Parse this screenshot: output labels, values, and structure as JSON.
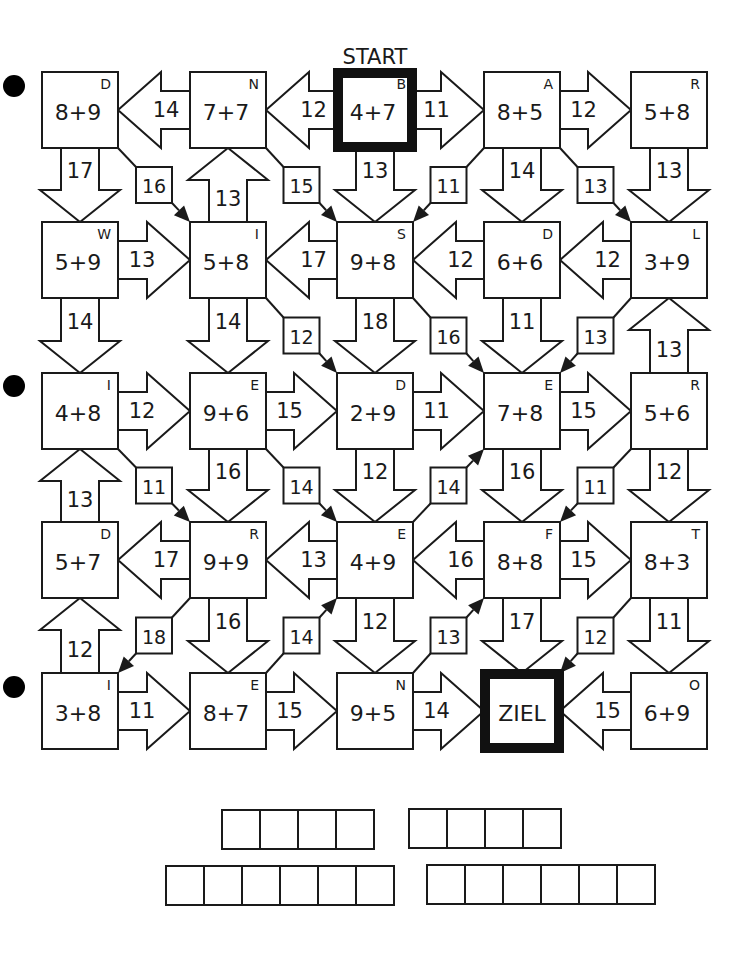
{
  "title": "START",
  "goal_label": "ZIEL",
  "grid": {
    "col_x": [
      42,
      190,
      337,
      484,
      631
    ],
    "row_y": [
      72,
      222,
      373,
      522,
      673
    ],
    "box_size": 76
  },
  "cells": [
    {
      "r": 0,
      "c": 0,
      "expr": "8+9",
      "letter": "D"
    },
    {
      "r": 0,
      "c": 1,
      "expr": "7+7",
      "letter": "N"
    },
    {
      "r": 0,
      "c": 2,
      "expr": "4+7",
      "letter": "B",
      "start": true
    },
    {
      "r": 0,
      "c": 3,
      "expr": "8+5",
      "letter": "A"
    },
    {
      "r": 0,
      "c": 4,
      "expr": "5+8",
      "letter": "R"
    },
    {
      "r": 1,
      "c": 0,
      "expr": "5+9",
      "letter": "W"
    },
    {
      "r": 1,
      "c": 1,
      "expr": "5+8",
      "letter": "I"
    },
    {
      "r": 1,
      "c": 2,
      "expr": "9+8",
      "letter": "S"
    },
    {
      "r": 1,
      "c": 3,
      "expr": "6+6",
      "letter": "D"
    },
    {
      "r": 1,
      "c": 4,
      "expr": "3+9",
      "letter": "L"
    },
    {
      "r": 2,
      "c": 0,
      "expr": "4+8",
      "letter": "I"
    },
    {
      "r": 2,
      "c": 1,
      "expr": "9+6",
      "letter": "E"
    },
    {
      "r": 2,
      "c": 2,
      "expr": "2+9",
      "letter": "D"
    },
    {
      "r": 2,
      "c": 3,
      "expr": "7+8",
      "letter": "E"
    },
    {
      "r": 2,
      "c": 4,
      "expr": "5+6",
      "letter": "R"
    },
    {
      "r": 3,
      "c": 0,
      "expr": "5+7",
      "letter": "D"
    },
    {
      "r": 3,
      "c": 1,
      "expr": "9+9",
      "letter": "R"
    },
    {
      "r": 3,
      "c": 2,
      "expr": "4+9",
      "letter": "E"
    },
    {
      "r": 3,
      "c": 3,
      "expr": "8+8",
      "letter": "F"
    },
    {
      "r": 3,
      "c": 4,
      "expr": "8+3",
      "letter": "T"
    },
    {
      "r": 4,
      "c": 0,
      "expr": "3+8",
      "letter": "I"
    },
    {
      "r": 4,
      "c": 1,
      "expr": "8+7",
      "letter": "E"
    },
    {
      "r": 4,
      "c": 2,
      "expr": "9+5",
      "letter": "N"
    },
    {
      "r": 4,
      "c": 3,
      "expr": "ZIEL",
      "letter": "",
      "goal": true
    },
    {
      "r": 4,
      "c": 4,
      "expr": "6+9",
      "letter": "O"
    }
  ],
  "h_arrows": [
    {
      "r": 0,
      "c": 0,
      "dir": "left",
      "value": "14"
    },
    {
      "r": 0,
      "c": 1,
      "dir": "left",
      "value": "12"
    },
    {
      "r": 0,
      "c": 2,
      "dir": "right",
      "value": "11"
    },
    {
      "r": 0,
      "c": 3,
      "dir": "right",
      "value": "12"
    },
    {
      "r": 1,
      "c": 0,
      "dir": "right",
      "value": "13"
    },
    {
      "r": 1,
      "c": 1,
      "dir": "left",
      "value": "17"
    },
    {
      "r": 1,
      "c": 2,
      "dir": "left",
      "value": "12"
    },
    {
      "r": 1,
      "c": 3,
      "dir": "left",
      "value": "12"
    },
    {
      "r": 2,
      "c": 0,
      "dir": "right",
      "value": "12"
    },
    {
      "r": 2,
      "c": 1,
      "dir": "right",
      "value": "15"
    },
    {
      "r": 2,
      "c": 2,
      "dir": "right",
      "value": "11"
    },
    {
      "r": 2,
      "c": 3,
      "dir": "right",
      "value": "15"
    },
    {
      "r": 3,
      "c": 0,
      "dir": "left",
      "value": "17"
    },
    {
      "r": 3,
      "c": 1,
      "dir": "left",
      "value": "13"
    },
    {
      "r": 3,
      "c": 2,
      "dir": "left",
      "value": "16"
    },
    {
      "r": 3,
      "c": 3,
      "dir": "right",
      "value": "15"
    },
    {
      "r": 4,
      "c": 0,
      "dir": "right",
      "value": "11"
    },
    {
      "r": 4,
      "c": 1,
      "dir": "right",
      "value": "15"
    },
    {
      "r": 4,
      "c": 2,
      "dir": "right",
      "value": "14"
    },
    {
      "r": 4,
      "c": 3,
      "dir": "left",
      "value": "15"
    }
  ],
  "v_arrows": [
    {
      "r": 0,
      "c": 0,
      "dir": "down",
      "value": "17"
    },
    {
      "r": 0,
      "c": 1,
      "dir": "up",
      "value": "13"
    },
    {
      "r": 0,
      "c": 2,
      "dir": "down",
      "value": "13"
    },
    {
      "r": 0,
      "c": 3,
      "dir": "down",
      "value": "14"
    },
    {
      "r": 0,
      "c": 4,
      "dir": "down",
      "value": "13"
    },
    {
      "r": 1,
      "c": 0,
      "dir": "down",
      "value": "14"
    },
    {
      "r": 1,
      "c": 1,
      "dir": "down",
      "value": "14"
    },
    {
      "r": 1,
      "c": 2,
      "dir": "down",
      "value": "18"
    },
    {
      "r": 1,
      "c": 3,
      "dir": "down",
      "value": "11"
    },
    {
      "r": 1,
      "c": 4,
      "dir": "up",
      "value": "13"
    },
    {
      "r": 2,
      "c": 0,
      "dir": "up",
      "value": "13"
    },
    {
      "r": 2,
      "c": 1,
      "dir": "down",
      "value": "16"
    },
    {
      "r": 2,
      "c": 2,
      "dir": "down",
      "value": "12"
    },
    {
      "r": 2,
      "c": 3,
      "dir": "down",
      "value": "16"
    },
    {
      "r": 2,
      "c": 4,
      "dir": "down",
      "value": "12"
    },
    {
      "r": 3,
      "c": 0,
      "dir": "up",
      "value": "12"
    },
    {
      "r": 3,
      "c": 1,
      "dir": "down",
      "value": "16"
    },
    {
      "r": 3,
      "c": 2,
      "dir": "down",
      "value": "12"
    },
    {
      "r": 3,
      "c": 3,
      "dir": "down",
      "value": "17"
    },
    {
      "r": 3,
      "c": 4,
      "dir": "down",
      "value": "11"
    }
  ],
  "diagonals": [
    {
      "r": 0,
      "c": 0,
      "dir": "se",
      "value": "16"
    },
    {
      "r": 0,
      "c": 1,
      "dir": "se",
      "value": "15"
    },
    {
      "r": 0,
      "c": 2,
      "dir": "sw",
      "value": "11"
    },
    {
      "r": 0,
      "c": 3,
      "dir": "se",
      "value": "13"
    },
    {
      "r": 1,
      "c": 1,
      "dir": "se",
      "value": "12"
    },
    {
      "r": 1,
      "c": 2,
      "dir": "se",
      "value": "16"
    },
    {
      "r": 1,
      "c": 3,
      "dir": "sw",
      "value": "13"
    },
    {
      "r": 2,
      "c": 0,
      "dir": "se",
      "value": "11"
    },
    {
      "r": 2,
      "c": 1,
      "dir": "se",
      "value": "14"
    },
    {
      "r": 2,
      "c": 2,
      "dir": "ne",
      "value": "14"
    },
    {
      "r": 2,
      "c": 3,
      "dir": "sw",
      "value": "11"
    },
    {
      "r": 3,
      "c": 0,
      "dir": "sw",
      "value": "18"
    },
    {
      "r": 3,
      "c": 1,
      "dir": "ne",
      "value": "14"
    },
    {
      "r": 3,
      "c": 2,
      "dir": "ne",
      "value": "13"
    },
    {
      "r": 3,
      "c": 3,
      "dir": "sw",
      "value": "12"
    }
  ],
  "punch_holes_y": [
    86,
    386,
    687
  ],
  "answer_rows": [
    {
      "x": 221,
      "y": 809,
      "cells": 4
    },
    {
      "x": 408,
      "y": 808,
      "cells": 4
    },
    {
      "x": 165,
      "y": 865,
      "cells": 6
    },
    {
      "x": 426,
      "y": 864,
      "cells": 6
    }
  ]
}
